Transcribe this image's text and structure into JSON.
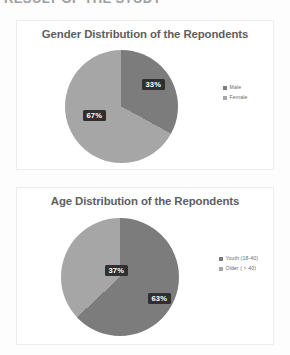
{
  "page": {
    "header_sliver_text": "RESULT OF THE STUDY",
    "background_color": "#fdfdfd"
  },
  "palette": {
    "slice_dark": "#7c7c7c",
    "slice_light": "#a6a6a6",
    "label_background": "#2f2f2f",
    "label_text": "#ffffff",
    "title_text": "#5e5e60",
    "legend_text": "#6b6b6d",
    "card_border": "#ededed"
  },
  "charts": [
    {
      "id": "gender",
      "title": "Gender Distribution of the Repondents",
      "legend_position": "right"
    },
    {
      "id": "age",
      "title": "Age Distribution of the Repondents",
      "legend_position": "right"
    }
  ],
  "labels": {
    "gender_male": "33%",
    "gender_female": "67%",
    "age_older": "37%",
    "age_youth": "63%"
  },
  "legend": {
    "gender": [
      {
        "label": "Male",
        "color": "#7c7c7c"
      },
      {
        "label": "Female",
        "color": "#a6a6a6"
      }
    ],
    "age": [
      {
        "label": "Youth (18-40)",
        "color": "#7c7c7c"
      },
      {
        "label": "Older ( > 40)",
        "color": "#a6a6a6"
      }
    ]
  },
  "chart_data": [
    {
      "type": "pie",
      "title": "Gender Distribution of the Repondents",
      "categories": [
        "Male",
        "Female"
      ],
      "values": [
        33,
        67
      ],
      "value_unit": "%",
      "data_labels": [
        "33%",
        "67%"
      ],
      "colors": [
        "#7c7c7c",
        "#a6a6a6"
      ],
      "start_angle_deg": 0,
      "direction": "clockwise",
      "legend": [
        "Male",
        "Female"
      ],
      "legend_position": "right",
      "grid": false
    },
    {
      "type": "pie",
      "title": "Age Distribution of the Repondents",
      "categories": [
        "Youth (18-40)",
        "Older ( > 40)"
      ],
      "values": [
        63,
        37
      ],
      "value_unit": "%",
      "data_labels": [
        "63%",
        "37%"
      ],
      "colors": [
        "#7c7c7c",
        "#a6a6a6"
      ],
      "start_angle_deg": 0,
      "direction": "clockwise",
      "legend": [
        "Youth (18-40)",
        "Older ( > 40)"
      ],
      "legend_position": "right",
      "grid": false
    }
  ]
}
